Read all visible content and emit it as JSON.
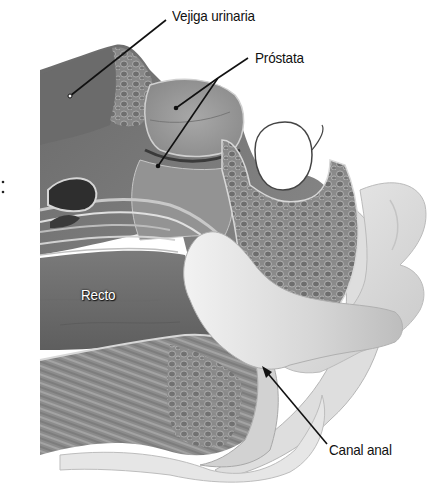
{
  "diagram": {
    "type": "anatomical illustration",
    "labels": [
      {
        "id": "bladder",
        "text": "Vejiga urinaria",
        "x": 172,
        "y": 7
      },
      {
        "id": "prostate",
        "text": "Próstata",
        "x": 255,
        "y": 49
      },
      {
        "id": "rectum",
        "text": "Recto",
        "x": 81,
        "y": 286
      },
      {
        "id": "anal_canal",
        "text": "Canal anal",
        "x": 329,
        "y": 441
      }
    ],
    "colors": {
      "tissue_dark": "#5a5a5a",
      "tissue_mid": "#8a8a8a",
      "tissue_light": "#b8b8b8",
      "skin": "#e2e2e2",
      "finger": "#d9d9d9",
      "leader_line": "#111111"
    }
  }
}
